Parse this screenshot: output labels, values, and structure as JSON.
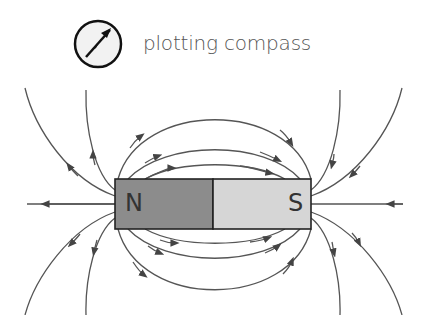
{
  "legend": {
    "icon": "compass-icon",
    "label": "plotting compass"
  },
  "magnet": {
    "north_label": "N",
    "south_label": "S",
    "north_color": "#8c8c8c",
    "south_color": "#d6d6d6",
    "outline_color": "#222222"
  },
  "field_lines": {
    "color": "#555555",
    "direction": "north-to-south"
  }
}
